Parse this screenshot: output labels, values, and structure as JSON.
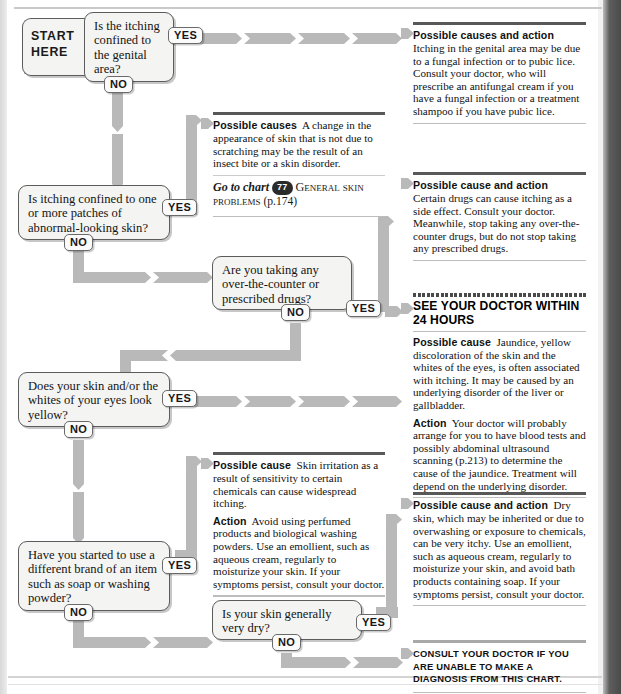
{
  "chart": {
    "start_label_line1": "START",
    "start_label_line2": "HERE",
    "yes_label": "YES",
    "no_label": "NO"
  },
  "questions": [
    {
      "id": "q1",
      "text": "Is the itching confined to the genital area?"
    },
    {
      "id": "q2",
      "text": "Is itching confined to one or more patches of abnormal-looking skin?"
    },
    {
      "id": "q3",
      "text": "Are you taking any over-the-counter or prescribed drugs?"
    },
    {
      "id": "q4",
      "text": "Does your skin and/or the whites of your eyes look yellow?"
    },
    {
      "id": "q5",
      "text": "Have you started to use a different brand of an item such as soap or washing powder?"
    },
    {
      "id": "q6",
      "text": "Is your skin generally very dry?"
    }
  ],
  "panels": {
    "genital": {
      "lead": "Possible causes and action",
      "body": "Itching in the genital area may be due to a fungal infection or to pubic lice. Consult your doctor, who will prescribe an antifungal cream if you have a fungal infection or a treatment shampoo if you have pubic lice."
    },
    "patches": {
      "lead": "Possible causes",
      "body": "A change in the appearance of skin that is not due to scratching may be the result of an insect bite or a skin disorder.",
      "goto_prefix": "Go to chart",
      "goto_badge": "77",
      "goto_title": "General skin problems",
      "goto_page": "(p.174)"
    },
    "drugs": {
      "lead": "Possible cause and action",
      "body": "Certain drugs can cause itching as a side effect. Consult your doctor. Meanwhile, stop taking any over-the-counter drugs, but do not stop taking any prescribed drugs."
    },
    "jaundice": {
      "header": "SEE YOUR DOCTOR WITHIN 24 HOURS",
      "lead1": "Possible cause",
      "body1": "Jaundice, yellow discoloration of the skin and the whites of the eyes, is often associated with itching. It may be caused by an underlying disorder of the liver or gallbladder.",
      "lead2": "Action",
      "body2": "Your doctor will probably arrange for you to have blood tests and possibly abdominal ultrasound scanning (p.213) to determine the cause of the jaundice. Treatment will depend on the underlying disorder."
    },
    "irritation": {
      "lead1": "Possible cause",
      "body1": "Skin irritation as a result of sensitivity to certain chemicals can cause widespread itching.",
      "lead2": "Action",
      "body2": "Avoid using perfumed products and biological washing powders. Use an emollient, such as aqueous cream, regularly to moisturize your skin. If your symptoms persist, consult your doctor."
    },
    "dryskin": {
      "lead": "Possible cause and action",
      "body": "Dry skin, which may be inherited or due to overwashing or exposure to chemicals, can be very itchy. Use an emollient, such as aqueous cream, regularly to moisturize your skin, and avoid bath products containing soap. If your symptoms persist, consult your doctor."
    },
    "consult": {
      "text": "Consult your doctor if you are unable to make a diagnosis from this chart."
    }
  },
  "colors": {
    "connector": "#b9b9b9",
    "box_fill": "#f4f4f2",
    "box_border": "#5c5c5c",
    "rule_dark": "#585858",
    "badge": "#2b2b2b"
  }
}
